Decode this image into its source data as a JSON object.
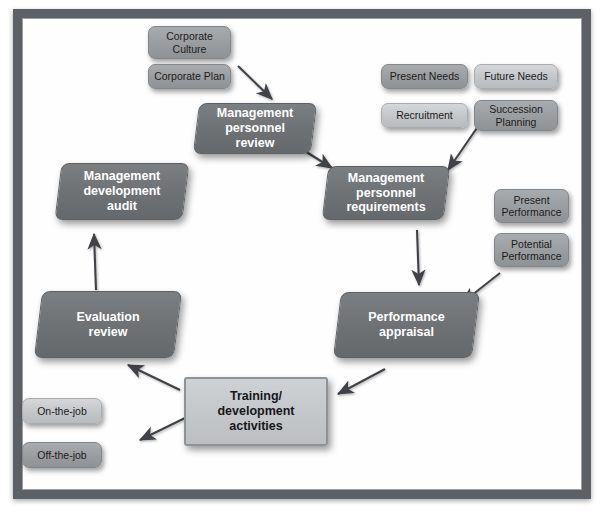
{
  "diagram": {
    "frame": {
      "border_color": "#5d6166",
      "background_color": "#ffffff"
    },
    "colors": {
      "process_block": "#6e7275",
      "chip_light": "#c3c6c9",
      "chip_mid": "#9a9d9f",
      "rect_block": "#c4c7ca",
      "arrow": "#3f4246",
      "process_text": "#ffffff",
      "chip_text": "#1c1c1c"
    },
    "inputs": {
      "corporate": [
        {
          "id": "corporate-culture",
          "label": "Corporate\nCulture",
          "tone": "mid"
        },
        {
          "id": "corporate-plan",
          "label": "Corporate Plan",
          "tone": "mid"
        }
      ],
      "needs": [
        {
          "id": "present-needs",
          "label": "Present Needs",
          "tone": "mid"
        },
        {
          "id": "future-needs",
          "label": "Future Needs",
          "tone": "light"
        },
        {
          "id": "recruitment",
          "label": "Recruitment",
          "tone": "light"
        },
        {
          "id": "succession-planning",
          "label": "Succession\nPlanning",
          "tone": "mid"
        }
      ],
      "performance": [
        {
          "id": "present-performance",
          "label": "Present\nPerformance",
          "tone": "mid"
        },
        {
          "id": "potential-performance",
          "label": "Potential\nPerformance",
          "tone": "mid"
        }
      ],
      "training_types": [
        {
          "id": "on-the-job",
          "label": "On-the-job",
          "tone": "light"
        },
        {
          "id": "off-the-job",
          "label": "Off-the-job",
          "tone": "mid"
        }
      ]
    },
    "processes": [
      {
        "id": "management-personnel-review",
        "label": "Management\npersonnel\nreview"
      },
      {
        "id": "management-personnel-requirements",
        "label": "Management\npersonnel\nrequirements"
      },
      {
        "id": "performance-appraisal",
        "label": "Performance\nappraisal"
      },
      {
        "id": "training-development-activities",
        "label": "Training/\ndevelopment\nactivities"
      },
      {
        "id": "evaluation-review",
        "label": "Evaluation\nreview"
      },
      {
        "id": "management-development-audit",
        "label": "Management\ndevelopment\naudit"
      }
    ],
    "flow": [
      {
        "from": "corporate-plan",
        "to": "management-personnel-review"
      },
      {
        "from": "management-personnel-review",
        "to": "management-personnel-requirements"
      },
      {
        "from": "needs-group",
        "to": "management-personnel-requirements"
      },
      {
        "from": "management-personnel-requirements",
        "to": "performance-appraisal"
      },
      {
        "from": "performance-group",
        "to": "performance-appraisal"
      },
      {
        "from": "performance-appraisal",
        "to": "training-development-activities"
      },
      {
        "from": "training-development-activities",
        "to": "training-types"
      },
      {
        "from": "training-development-activities",
        "to": "evaluation-review"
      },
      {
        "from": "evaluation-review",
        "to": "management-development-audit"
      }
    ]
  }
}
